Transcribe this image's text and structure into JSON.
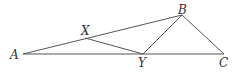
{
  "diagram": {
    "points": {
      "A": {
        "label": "A",
        "x": 23,
        "y": 54
      },
      "X": {
        "label": "X",
        "x": 85,
        "y": 38
      },
      "B": {
        "label": "B",
        "x": 182,
        "y": 15
      },
      "Y": {
        "label": "Y",
        "x": 143,
        "y": 54
      },
      "C": {
        "label": "C",
        "x": 224,
        "y": 54
      }
    },
    "segments": [
      "AB",
      "AC",
      "XY",
      "BY",
      "BC"
    ],
    "stroke_color": "#555555",
    "label_color": "#333333"
  }
}
